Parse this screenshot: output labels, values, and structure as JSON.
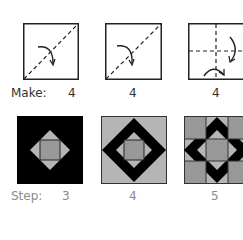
{
  "fold_row": {
    "label": "Make:",
    "items": [
      {
        "count": "4",
        "diagram": "diagonal-fold-bottom-left-to-top-right",
        "arrow": "curved-arrow-down-right"
      },
      {
        "count": "4",
        "diagram": "diagonal-fold-bottom-left-to-top-right",
        "arrow": "curved-arrow-down-right"
      },
      {
        "count": "4",
        "diagram": "cross-fold-horizontal-vertical",
        "arrow": "curved-arrows-right-and-bottom"
      }
    ]
  },
  "block_row": {
    "label": "Step:",
    "items": [
      {
        "step": "3",
        "pattern": "black-square-with-gray-diamond-center"
      },
      {
        "step": "4",
        "pattern": "gray-square-with-black-diamond-frame"
      },
      {
        "step": "5",
        "pattern": "nine-patch-star-block"
      }
    ]
  },
  "colors": {
    "black": "#000000",
    "light_gray": "#b5b5b5",
    "mid_gray": "#989898",
    "outline": "#333333",
    "make_text": "#333333",
    "step_text": "#8a8a8a"
  }
}
